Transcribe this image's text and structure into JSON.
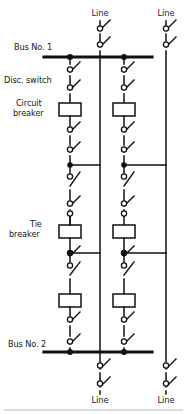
{
  "diagram": {
    "stroke_color": "#111111",
    "background_color": "#ffffff",
    "labels": {
      "bus1": "Bus No. 1",
      "bus2": "Bus No. 2",
      "disc_switch": "Disc. switch",
      "circuit_breaker_l1": "Circuit",
      "circuit_breaker_l2": "breaker",
      "tie_breaker_l1": "Tie",
      "tie_breaker_l2": "breaker",
      "line_top_center": "Line",
      "line_top_right": "Line",
      "line_bottom_center": "Line",
      "line_bottom_right": "Line"
    },
    "buses": [
      {
        "name": "Bus No. 1",
        "y": 57,
        "x1": 44,
        "x2": 152
      },
      {
        "name": "Bus No. 2",
        "y": 352,
        "x1": 44,
        "x2": 152
      }
    ],
    "bays": [
      {
        "name": "bay-left",
        "x": 70
      },
      {
        "name": "bay-right",
        "x": 124
      }
    ],
    "risers": [
      {
        "name": "riser-center",
        "x": 100
      },
      {
        "name": "riser-right",
        "x": 166
      }
    ],
    "junctions_y": [
      165,
      253
    ],
    "breaker_y": [
      110,
      232,
      301
    ],
    "counts": {
      "disconnect_switches": 20,
      "circuit_breakers": 4,
      "tie_breakers": 2,
      "lines": 4,
      "buses": 2
    }
  }
}
